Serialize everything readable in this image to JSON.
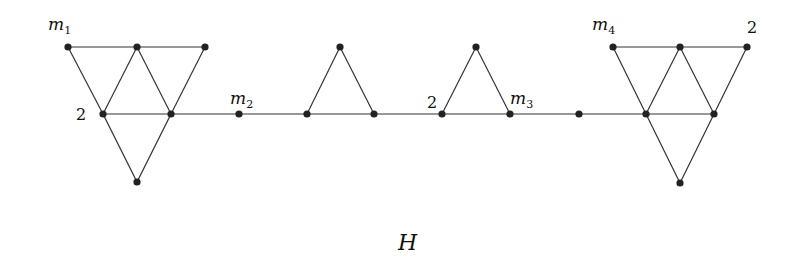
{
  "caption": "H",
  "nodes": [
    {
      "id": "a1",
      "x": 68,
      "y": 47
    },
    {
      "id": "a2",
      "x": 137,
      "y": 47
    },
    {
      "id": "a3",
      "x": 205,
      "y": 47
    },
    {
      "id": "a4",
      "x": 103,
      "y": 114
    },
    {
      "id": "a5",
      "x": 171,
      "y": 114
    },
    {
      "id": "a6",
      "x": 137,
      "y": 182
    },
    {
      "id": "b1",
      "x": 239,
      "y": 114
    },
    {
      "id": "c1",
      "x": 307,
      "y": 114
    },
    {
      "id": "c2",
      "x": 340,
      "y": 47
    },
    {
      "id": "c3",
      "x": 374,
      "y": 114
    },
    {
      "id": "d1",
      "x": 442,
      "y": 114
    },
    {
      "id": "d2",
      "x": 476,
      "y": 47
    },
    {
      "id": "d3",
      "x": 510,
      "y": 114
    },
    {
      "id": "e1",
      "x": 579,
      "y": 114
    },
    {
      "id": "f1",
      "x": 613,
      "y": 47
    },
    {
      "id": "f2",
      "x": 680,
      "y": 47
    },
    {
      "id": "f3",
      "x": 747,
      "y": 47
    },
    {
      "id": "f4",
      "x": 646,
      "y": 114
    },
    {
      "id": "f5",
      "x": 714,
      "y": 114
    },
    {
      "id": "f6",
      "x": 680,
      "y": 183
    }
  ],
  "edges": [
    [
      "a1",
      "a2"
    ],
    [
      "a2",
      "a3"
    ],
    [
      "a1",
      "a4"
    ],
    [
      "a2",
      "a4"
    ],
    [
      "a2",
      "a5"
    ],
    [
      "a3",
      "a5"
    ],
    [
      "a4",
      "a5"
    ],
    [
      "a4",
      "a6"
    ],
    [
      "a5",
      "a6"
    ],
    [
      "a5",
      "b1"
    ],
    [
      "b1",
      "c1"
    ],
    [
      "c1",
      "c2"
    ],
    [
      "c2",
      "c3"
    ],
    [
      "c1",
      "c3"
    ],
    [
      "c3",
      "d1"
    ],
    [
      "d1",
      "d2"
    ],
    [
      "d2",
      "d3"
    ],
    [
      "d1",
      "d3"
    ],
    [
      "d3",
      "e1"
    ],
    [
      "e1",
      "f4"
    ],
    [
      "f1",
      "f2"
    ],
    [
      "f2",
      "f3"
    ],
    [
      "f1",
      "f4"
    ],
    [
      "f2",
      "f4"
    ],
    [
      "f2",
      "f5"
    ],
    [
      "f3",
      "f5"
    ],
    [
      "f4",
      "f5"
    ],
    [
      "f4",
      "f6"
    ],
    [
      "f5",
      "f6"
    ]
  ],
  "labels": [
    {
      "text": "m",
      "sub": "1",
      "x": 48,
      "y": 30,
      "kind": "var"
    },
    {
      "text": "2",
      "x": 76,
      "y": 120,
      "kind": "num"
    },
    {
      "text": "m",
      "sub": "2",
      "x": 230,
      "y": 104,
      "kind": "var"
    },
    {
      "text": "2",
      "x": 427,
      "y": 108,
      "kind": "num"
    },
    {
      "text": "m",
      "sub": "3",
      "x": 510,
      "y": 104,
      "kind": "var"
    },
    {
      "text": "m",
      "sub": "4",
      "x": 592,
      "y": 30,
      "kind": "var"
    },
    {
      "text": "2",
      "x": 747,
      "y": 33,
      "kind": "num"
    }
  ]
}
